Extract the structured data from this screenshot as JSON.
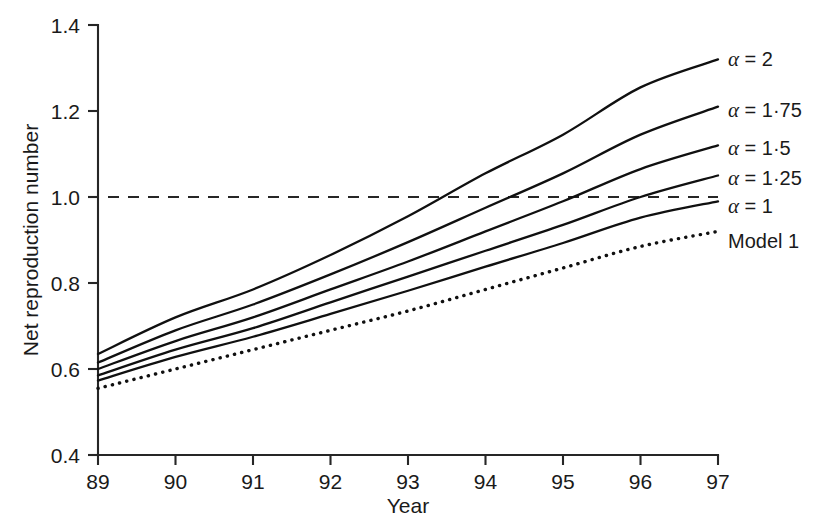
{
  "chart_data": {
    "type": "line",
    "title": "",
    "xlabel": "Year",
    "ylabel": "Net reproduction number",
    "xlim": [
      89,
      97
    ],
    "ylim": [
      0.4,
      1.4
    ],
    "xticks": [
      "89",
      "90",
      "91",
      "92",
      "93",
      "94",
      "95",
      "96",
      "97"
    ],
    "yticks": [
      "1.4",
      "1.2",
      "1.0",
      "0.8",
      "0.6",
      "0.4"
    ],
    "grid": false,
    "legend_position": "right-inline-end-of-line",
    "annotations": [
      {
        "name": "threshold",
        "value": 1.0,
        "style": "dashed-horizontal",
        "label": ""
      }
    ],
    "x": [
      89,
      90,
      91,
      92,
      93,
      94,
      95,
      96,
      97
    ],
    "series": [
      {
        "name": "alpha-2",
        "label": "α = 2",
        "label_alpha": "α",
        "label_rest": " = 2",
        "style": "solid",
        "values": [
          0.635,
          0.72,
          0.785,
          0.865,
          0.955,
          1.055,
          1.145,
          1.255,
          1.32
        ]
      },
      {
        "name": "alpha-1-75",
        "label": "α = 1·75",
        "label_alpha": "α",
        "label_rest": " = 1·75",
        "style": "solid",
        "values": [
          0.615,
          0.69,
          0.75,
          0.82,
          0.895,
          0.975,
          1.055,
          1.145,
          1.21
        ]
      },
      {
        "name": "alpha-1-5",
        "label": "α = 1·5",
        "label_alpha": "α",
        "label_rest": " = 1·5",
        "style": "solid",
        "values": [
          0.6,
          0.665,
          0.72,
          0.785,
          0.85,
          0.92,
          0.99,
          1.065,
          1.12
        ]
      },
      {
        "name": "alpha-1-25",
        "label": "α = 1·25",
        "label_alpha": "α",
        "label_rest": " = 1·25",
        "style": "solid",
        "values": [
          0.585,
          0.645,
          0.695,
          0.755,
          0.815,
          0.875,
          0.935,
          1.0,
          1.05
        ]
      },
      {
        "name": "alpha-1",
        "label": "α = 1",
        "label_alpha": "α",
        "label_rest": " = 1",
        "style": "solid",
        "values": [
          0.573,
          0.628,
          0.675,
          0.728,
          0.782,
          0.838,
          0.893,
          0.952,
          0.99
        ]
      },
      {
        "name": "model-1",
        "label": "Model 1",
        "label_alpha": "",
        "label_rest": "Model 1",
        "style": "dotted",
        "values": [
          0.555,
          0.6,
          0.645,
          0.69,
          0.735,
          0.785,
          0.835,
          0.885,
          0.92
        ]
      }
    ]
  },
  "colors": {
    "line": "#101010",
    "axis": "#262626",
    "background": "#ffffff"
  }
}
